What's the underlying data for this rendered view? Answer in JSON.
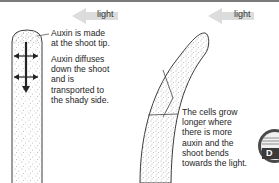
{
  "diagram": {
    "left_panel": {
      "light_label": "light",
      "caption_tip": "Auxin is made\nat the shoot tip.",
      "caption_diffuse": "Auxin diffuses\ndown the shoot\nand is\ntransported to\nthe shady side."
    },
    "right_panel": {
      "light_label": "light",
      "caption_bend": "The cells grow\nlonger where\nthere is more\nauxin and the\nshoot bends\ntowards the light."
    },
    "badge": {
      "letter": "D",
      "color": "#4a4a4a"
    },
    "colors": {
      "outline": "#3c3c3c",
      "stipple": "#6e6e6e",
      "light_arrow": "#d8d8d8",
      "top_border": "#7a7a7a"
    }
  }
}
